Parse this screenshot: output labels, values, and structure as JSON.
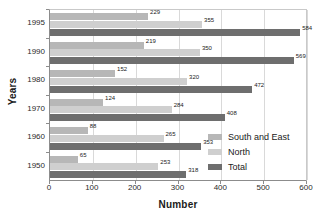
{
  "chart_data": {
    "type": "bar",
    "orientation": "horizontal",
    "title": "",
    "xlabel": "Number",
    "ylabel": "Years",
    "categories": [
      "1995",
      "1990",
      "1980",
      "1970",
      "1960",
      "1950"
    ],
    "series": [
      {
        "name": "South and East",
        "color": "#b7b7b7",
        "values": [
          229,
          219,
          152,
          124,
          88,
          65
        ]
      },
      {
        "name": "North",
        "color": "#cfcfcf",
        "values": [
          355,
          350,
          320,
          284,
          265,
          253
        ]
      },
      {
        "name": "Total",
        "color": "#6e6e6e",
        "values": [
          584,
          569,
          472,
          408,
          353,
          318
        ]
      }
    ],
    "xlim": [
      0,
      600
    ],
    "xticks": [
      0,
      100,
      200,
      300,
      400,
      500,
      600
    ],
    "xtick_labels": [
      "0",
      "100",
      "200",
      "300",
      "400",
      "500",
      "600"
    ],
    "grid": "vertical",
    "legend_position": "lower-right-inside",
    "legend_entries": [
      "South and East",
      "North",
      "Total"
    ]
  }
}
